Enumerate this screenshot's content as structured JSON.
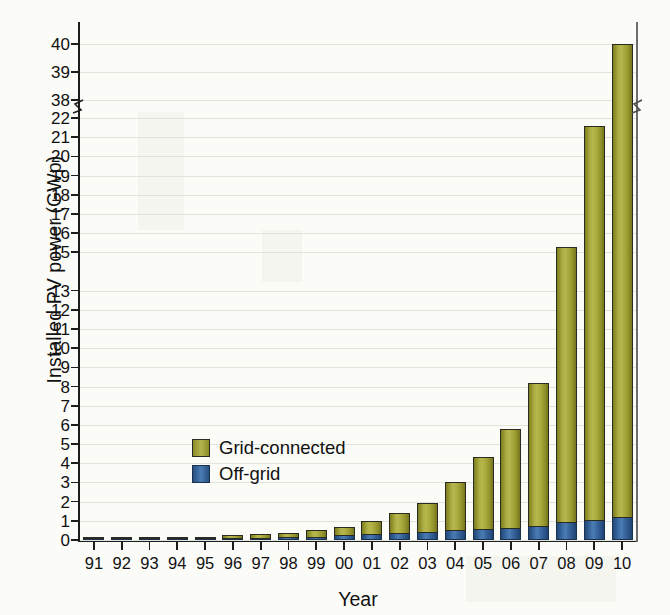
{
  "chart_data": {
    "type": "bar",
    "stacked": true,
    "title": "",
    "xlabel": "Year",
    "ylabel": "Installed PV power (GWp)",
    "categories": [
      "91",
      "92",
      "93",
      "94",
      "95",
      "96",
      "97",
      "98",
      "99",
      "00",
      "01",
      "02",
      "03",
      "04",
      "05",
      "06",
      "07",
      "08",
      "09",
      "10"
    ],
    "series": [
      {
        "name": "Off-grid",
        "color": "#3a6da4",
        "values": [
          0.04,
          0.05,
          0.06,
          0.07,
          0.09,
          0.11,
          0.13,
          0.15,
          0.18,
          0.25,
          0.3,
          0.35,
          0.42,
          0.5,
          0.55,
          0.62,
          0.72,
          0.95,
          1.05,
          1.2
        ]
      },
      {
        "name": "Grid-connected",
        "color": "#a8a83c",
        "values": [
          0.02,
          0.03,
          0.04,
          0.06,
          0.08,
          0.14,
          0.17,
          0.2,
          0.32,
          0.45,
          0.7,
          1.05,
          1.53,
          2.5,
          3.8,
          5.18,
          7.48,
          14.35,
          20.55,
          38.8
        ]
      }
    ],
    "totals": [
      0.06,
      0.08,
      0.1,
      0.13,
      0.17,
      0.25,
      0.3,
      0.35,
      0.5,
      0.7,
      1.0,
      1.4,
      1.95,
      3.0,
      4.35,
      5.8,
      8.2,
      15.3,
      21.6,
      40.0
    ],
    "ylim": [
      0,
      22
    ],
    "y_ticks": [
      "0",
      "1",
      "2",
      "3",
      "4",
      "5",
      "6",
      "7",
      "8",
      "9",
      "10",
      "11",
      "12",
      "13",
      "15",
      "16",
      "17",
      "18",
      "19",
      "20",
      "21",
      "22"
    ],
    "y_ticks_upper": [
      "38",
      "39",
      "40"
    ],
    "axis_break": true,
    "axis_break_between": "22 and 38",
    "grid": true,
    "legend_position": "inside-left",
    "legend": [
      "Grid-connected",
      "Off-grid"
    ],
    "colors": {
      "grid_connected": "#a8a83c",
      "off_grid": "#3a6da4",
      "axis": "#1d1d1d",
      "gridline": "#e3e3de",
      "background": "#fbfbf8"
    }
  }
}
